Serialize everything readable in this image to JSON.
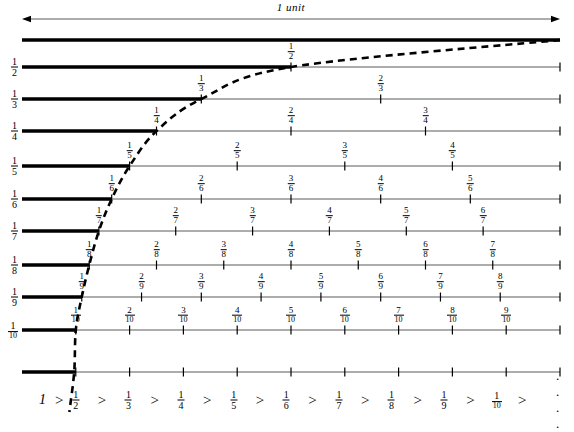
{
  "figure": {
    "title_annotation": "1 unit",
    "axis_left_px": 22,
    "axis_right_px": 560,
    "type": "harmonic-fraction-number-lines"
  },
  "chart_data": {
    "type": "line",
    "title": "1 unit",
    "xlabel": "",
    "ylabel": "",
    "xlim": [
      0,
      1
    ],
    "ylim": [
      0,
      1
    ],
    "grid": false,
    "legend": null,
    "rows": [
      {
        "n": 1,
        "row_label": "",
        "bold_end": 1.0,
        "ticks": [],
        "tick_labels": [],
        "endpoint_tick": false,
        "y_px": 40
      },
      {
        "n": 2,
        "row_label": "1/2",
        "bold_end": 0.5,
        "ticks": [
          0.5
        ],
        "tick_labels": [
          "1/2"
        ],
        "endpoint_tick": true,
        "y_px": 67
      },
      {
        "n": 3,
        "row_label": "1/3",
        "bold_end": 0.3333,
        "ticks": [
          0.3333,
          0.6667
        ],
        "tick_labels": [
          "1/3",
          "2/3"
        ],
        "endpoint_tick": true,
        "y_px": 99
      },
      {
        "n": 4,
        "row_label": "1/4",
        "bold_end": 0.25,
        "ticks": [
          0.25,
          0.5,
          0.75
        ],
        "tick_labels": [
          "1/4",
          "2/4",
          "3/4"
        ],
        "endpoint_tick": true,
        "y_px": 131
      },
      {
        "n": 5,
        "row_label": "1/5",
        "bold_end": 0.2,
        "ticks": [
          0.2,
          0.4,
          0.6,
          0.8
        ],
        "tick_labels": [
          "1/5",
          "2/5",
          "3/5",
          "4/5"
        ],
        "endpoint_tick": true,
        "y_px": 166
      },
      {
        "n": 6,
        "row_label": "1/6",
        "bold_end": 0.1667,
        "ticks": [
          0.1667,
          0.3333,
          0.5,
          0.6667,
          0.8333
        ],
        "tick_labels": [
          "1/6",
          "2/6",
          "3/6",
          "4/6",
          "5/6"
        ],
        "endpoint_tick": true,
        "y_px": 199
      },
      {
        "n": 7,
        "row_label": "1/7",
        "bold_end": 0.1429,
        "ticks": [
          0.1429,
          0.2857,
          0.4286,
          0.5714,
          0.7143,
          0.8571
        ],
        "tick_labels": [
          "1/7",
          "2/7",
          "3/7",
          "4/7",
          "5/7",
          "6/7"
        ],
        "endpoint_tick": true,
        "y_px": 231
      },
      {
        "n": 8,
        "row_label": "1/8",
        "bold_end": 0.125,
        "ticks": [
          0.125,
          0.25,
          0.375,
          0.5,
          0.625,
          0.75,
          0.875
        ],
        "tick_labels": [
          "1/8",
          "2/8",
          "3/8",
          "4/8",
          "5/8",
          "6/8",
          "7/8"
        ],
        "endpoint_tick": true,
        "y_px": 265
      },
      {
        "n": 9,
        "row_label": "1/9",
        "bold_end": 0.1111,
        "ticks": [
          0.1111,
          0.2222,
          0.3333,
          0.4444,
          0.5556,
          0.6667,
          0.7778,
          0.8889
        ],
        "tick_labels": [
          "1/9",
          "2/9",
          "3/9",
          "4/9",
          "5/9",
          "6/9",
          "7/9",
          "8/9"
        ],
        "endpoint_tick": true,
        "y_px": 297
      },
      {
        "n": 10,
        "row_label": "1/10",
        "bold_end": 0.1,
        "ticks": [
          0.1,
          0.2,
          0.3,
          0.4,
          0.5,
          0.6,
          0.7,
          0.8,
          0.9
        ],
        "tick_labels": [
          "1/10",
          "2/10",
          "3/10",
          "4/10",
          "5/10",
          "6/10",
          "7/10",
          "8/10",
          "9/10"
        ],
        "endpoint_tick": true,
        "y_px": 330
      },
      {
        "n": 0,
        "row_label": "",
        "bold_end": 0.1,
        "ticks": [
          0.1,
          0.2,
          0.3,
          0.4,
          0.5,
          0.6,
          0.7,
          0.8,
          0.9
        ],
        "tick_labels": [],
        "endpoint_tick": true,
        "y_px": 372
      }
    ],
    "curve": {
      "style": "dashed",
      "label": "",
      "points_through": [
        {
          "x": 1.0,
          "y_row": 1
        },
        {
          "x": 0.5,
          "y_row": 2
        },
        {
          "x": 0.3333,
          "y_row": 3
        },
        {
          "x": 0.25,
          "y_row": 4
        },
        {
          "x": 0.2,
          "y_row": 5
        },
        {
          "x": 0.1667,
          "y_row": 6
        },
        {
          "x": 0.1429,
          "y_row": 7
        },
        {
          "x": 0.125,
          "y_row": 8
        },
        {
          "x": 0.1111,
          "y_row": 9
        },
        {
          "x": 0.1,
          "y_row": 10
        }
      ]
    },
    "unit_arrow": {
      "label": "1 unit",
      "from_x": 0,
      "to_x": 1,
      "double_headed": true
    }
  },
  "bottom_sequence": {
    "first": "1",
    "separator": ">",
    "terms": [
      "1/2",
      "1/3",
      "1/4",
      "1/5",
      "1/6",
      "1/7",
      "1/8",
      "1/9",
      "1/10"
    ],
    "trailing": ". . . ."
  },
  "colors": {
    "ink": "#000000",
    "thin_line": "#5a5a5a",
    "background": "#ffffff"
  }
}
